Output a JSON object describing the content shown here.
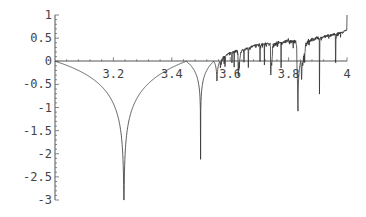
{
  "chart_data": {
    "type": "line",
    "title": "",
    "xlabel": "",
    "ylabel": "",
    "function": "logistic_lyapunov",
    "xlim": [
      3.0,
      4.0
    ],
    "ylim": [
      -3.0,
      1.0
    ],
    "x_ticks": [
      3.2,
      3.4,
      3.6,
      3.8,
      4
    ],
    "x_tick_labels": [
      "3.2",
      "3.4",
      "3.6",
      "3.8",
      "4"
    ],
    "y_ticks": [
      1,
      0.5,
      0,
      -0.5,
      -1,
      -1.5,
      -2,
      -2.5,
      -3
    ],
    "y_tick_labels": [
      "1",
      "0.5",
      "0",
      "-0.5",
      "-1",
      "-1.5",
      "-2",
      "-2.5",
      "-3"
    ],
    "grid": false,
    "legend": "none",
    "samples": 1400,
    "iterations": {
      "transient": 300,
      "average": 300
    },
    "key_points": [
      {
        "x": 3.0,
        "y": 0.0
      },
      {
        "x": 3.236,
        "y": -3.0
      },
      {
        "x": 3.449,
        "y": 0.0
      },
      {
        "x": 3.4985,
        "y": -1.1
      },
      {
        "x": 3.5545,
        "y": -0.1
      },
      {
        "x": 3.5699,
        "y": 0.0
      },
      {
        "x": 3.6275,
        "y": -0.05
      },
      {
        "x": 3.7385,
        "y": -0.05
      },
      {
        "x": 3.8284,
        "y": -0.85
      },
      {
        "x": 4.0,
        "y": 0.69
      }
    ],
    "series": [
      {
        "name": "lyapunov-exponent",
        "color": "#333333"
      }
    ]
  }
}
